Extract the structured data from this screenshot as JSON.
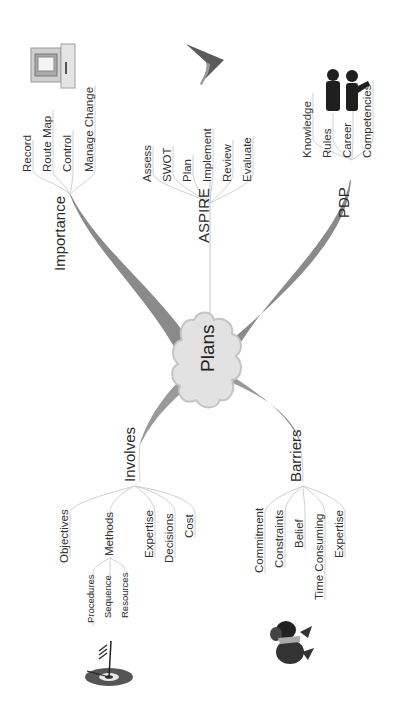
{
  "center": {
    "label": "Plans"
  },
  "branches": {
    "importance": {
      "label": "Importance",
      "children": [
        "Record",
        "Route Map",
        "Control",
        "Manage Change"
      ],
      "icon": "computer-icon"
    },
    "aspire": {
      "label": "ASPIRE",
      "children": [
        "Assess",
        "SWOT",
        "Plan",
        "Implement",
        "Review",
        "Evaluate"
      ],
      "icon": "arrowhead-icon"
    },
    "pdp": {
      "label": "PDP",
      "children": [
        "Knowledge",
        "Rules",
        "Career",
        "Competencies"
      ],
      "icon": "people-icon"
    },
    "involves": {
      "label": "Involves",
      "children": [
        "Objectives",
        "Methods",
        "Expertise",
        "Decisions",
        "Cost"
      ],
      "methods_children": [
        "Procedures",
        "Sequence",
        "Resources"
      ],
      "icon": "target-icon"
    },
    "barriers": {
      "label": "Barriers",
      "children": [
        "Commitment",
        "Constraints",
        "Belief",
        "Time Consuming",
        "Expertise"
      ],
      "icon": "struggle-figure-icon"
    }
  },
  "colors": {
    "branch_fill": "#8a8a8a",
    "thin_line": "#d0d0d0",
    "cloud_fill": "#e2e2e2",
    "cloud_stroke": "#c4c4c4"
  }
}
